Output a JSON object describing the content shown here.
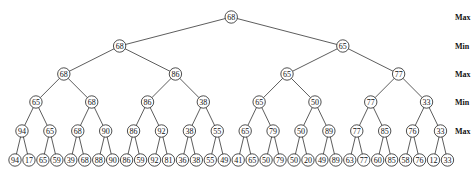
{
  "diagram": {
    "type": "minimax-game-tree",
    "level_labels": [
      "Max",
      "Min",
      "Max",
      "Min",
      "Max"
    ],
    "levels": [
      [
        68
      ],
      [
        68,
        65
      ],
      [
        68,
        86,
        65,
        77
      ],
      [
        65,
        68,
        86,
        38,
        65,
        50,
        77,
        33
      ],
      [
        94,
        65,
        68,
        90,
        86,
        92,
        38,
        55,
        65,
        79,
        50,
        89,
        77,
        85,
        76,
        33
      ],
      [
        94,
        17,
        65,
        59,
        39,
        68,
        88,
        90,
        86,
        59,
        92,
        81,
        36,
        38,
        55,
        49,
        41,
        65,
        50,
        79,
        50,
        20,
        49,
        89,
        63,
        77,
        60,
        85,
        58,
        76,
        12,
        33
      ]
    ]
  }
}
